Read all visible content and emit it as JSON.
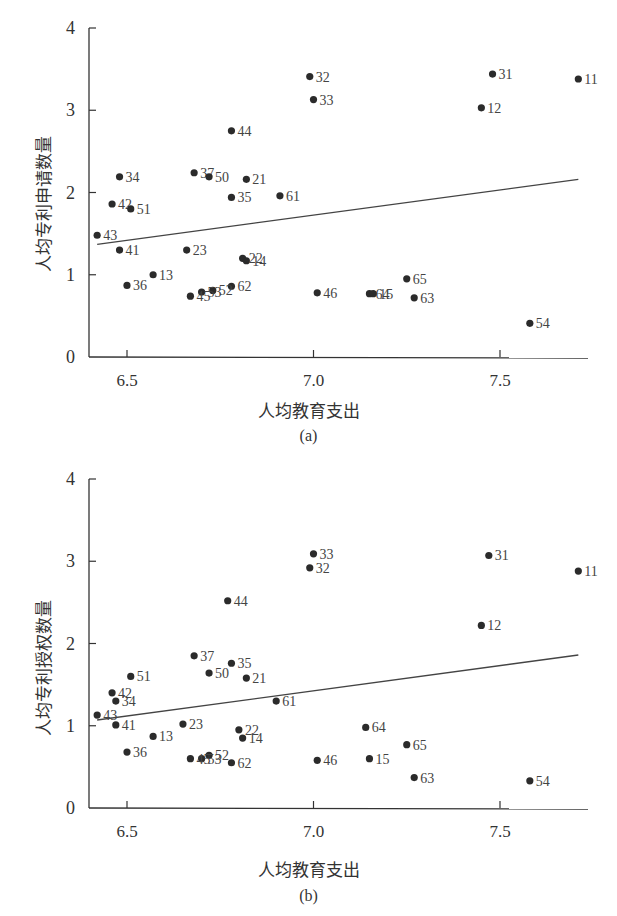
{
  "chart_data": [
    {
      "type": "scatter",
      "panel": "(a)",
      "title": "",
      "xlabel": "人均教育支出",
      "ylabel": "人均专利申请数量",
      "xlim": [
        6.4,
        7.75
      ],
      "ylim": [
        0,
        4
      ],
      "xticks": [
        6.5,
        7.0,
        7.5
      ],
      "xtick_labels": [
        "6.5",
        "7.0",
        "7.5"
      ],
      "yticks": [
        0,
        1,
        2,
        3,
        4
      ],
      "ytick_labels": [
        "0",
        "1",
        "2",
        "3",
        "4"
      ],
      "grid": false,
      "legend": null,
      "trendline": {
        "x": [
          6.42,
          7.71
        ],
        "y": [
          1.37,
          2.16
        ]
      },
      "points": [
        {
          "label": "11",
          "x": 7.71,
          "y": 3.38
        },
        {
          "label": "31",
          "x": 7.48,
          "y": 3.44
        },
        {
          "label": "12",
          "x": 7.45,
          "y": 3.03
        },
        {
          "label": "32",
          "x": 6.99,
          "y": 3.41
        },
        {
          "label": "33",
          "x": 7.0,
          "y": 3.13
        },
        {
          "label": "44",
          "x": 6.78,
          "y": 2.75
        },
        {
          "label": "37",
          "x": 6.68,
          "y": 2.24
        },
        {
          "label": "50",
          "x": 6.72,
          "y": 2.19
        },
        {
          "label": "21",
          "x": 6.82,
          "y": 2.16
        },
        {
          "label": "34",
          "x": 6.48,
          "y": 2.19
        },
        {
          "label": "35",
          "x": 6.78,
          "y": 1.94
        },
        {
          "label": "61",
          "x": 6.91,
          "y": 1.96
        },
        {
          "label": "42",
          "x": 6.46,
          "y": 1.86
        },
        {
          "label": "51",
          "x": 6.51,
          "y": 1.8
        },
        {
          "label": "43",
          "x": 6.42,
          "y": 1.48
        },
        {
          "label": "41",
          "x": 6.48,
          "y": 1.3
        },
        {
          "label": "23",
          "x": 6.66,
          "y": 1.3
        },
        {
          "label": "22",
          "x": 6.81,
          "y": 1.2
        },
        {
          "label": "14",
          "x": 6.82,
          "y": 1.17
        },
        {
          "label": "13",
          "x": 6.57,
          "y": 1.0
        },
        {
          "label": "36",
          "x": 6.5,
          "y": 0.87
        },
        {
          "label": "62",
          "x": 6.78,
          "y": 0.86
        },
        {
          "label": "52",
          "x": 6.73,
          "y": 0.81
        },
        {
          "label": "53",
          "x": 6.7,
          "y": 0.79
        },
        {
          "label": "45",
          "x": 6.67,
          "y": 0.74
        },
        {
          "label": "46",
          "x": 7.01,
          "y": 0.78
        },
        {
          "label": "64",
          "x": 7.15,
          "y": 0.77
        },
        {
          "label": "15",
          "x": 7.16,
          "y": 0.77
        },
        {
          "label": "65",
          "x": 7.25,
          "y": 0.95
        },
        {
          "label": "63",
          "x": 7.27,
          "y": 0.72
        },
        {
          "label": "54",
          "x": 7.58,
          "y": 0.41
        }
      ]
    },
    {
      "type": "scatter",
      "panel": "(b)",
      "title": "",
      "xlabel": "人均教育支出",
      "ylabel": "人均专利授权数量",
      "xlim": [
        6.4,
        7.75
      ],
      "ylim": [
        0,
        4
      ],
      "xticks": [
        6.5,
        7.0,
        7.5
      ],
      "xtick_labels": [
        "6.5",
        "7.0",
        "7.5"
      ],
      "yticks": [
        0,
        1,
        2,
        3,
        4
      ],
      "ytick_labels": [
        "0",
        "1",
        "2",
        "3",
        "4"
      ],
      "grid": false,
      "legend": null,
      "trendline": {
        "x": [
          6.42,
          7.71
        ],
        "y": [
          1.07,
          1.86
        ]
      },
      "points": [
        {
          "label": "33",
          "x": 7.0,
          "y": 3.09
        },
        {
          "label": "32",
          "x": 6.99,
          "y": 2.92
        },
        {
          "label": "31",
          "x": 7.47,
          "y": 3.07
        },
        {
          "label": "11",
          "x": 7.71,
          "y": 2.88
        },
        {
          "label": "12",
          "x": 7.45,
          "y": 2.22
        },
        {
          "label": "44",
          "x": 6.77,
          "y": 2.52
        },
        {
          "label": "37",
          "x": 6.68,
          "y": 1.85
        },
        {
          "label": "35",
          "x": 6.78,
          "y": 1.76
        },
        {
          "label": "50",
          "x": 6.72,
          "y": 1.64
        },
        {
          "label": "21",
          "x": 6.82,
          "y": 1.58
        },
        {
          "label": "51",
          "x": 6.51,
          "y": 1.6
        },
        {
          "label": "42",
          "x": 6.46,
          "y": 1.4
        },
        {
          "label": "34",
          "x": 6.47,
          "y": 1.3
        },
        {
          "label": "43",
          "x": 6.42,
          "y": 1.13
        },
        {
          "label": "41",
          "x": 6.47,
          "y": 1.01
        },
        {
          "label": "61",
          "x": 6.9,
          "y": 1.3
        },
        {
          "label": "23",
          "x": 6.65,
          "y": 1.02
        },
        {
          "label": "22",
          "x": 6.8,
          "y": 0.95
        },
        {
          "label": "14",
          "x": 6.81,
          "y": 0.85
        },
        {
          "label": "13",
          "x": 6.57,
          "y": 0.87
        },
        {
          "label": "36",
          "x": 6.5,
          "y": 0.68
        },
        {
          "label": "52",
          "x": 6.72,
          "y": 0.64
        },
        {
          "label": "53",
          "x": 6.7,
          "y": 0.6
        },
        {
          "label": "45",
          "x": 6.67,
          "y": 0.6
        },
        {
          "label": "62",
          "x": 6.78,
          "y": 0.55
        },
        {
          "label": "64",
          "x": 7.14,
          "y": 0.98
        },
        {
          "label": "65",
          "x": 7.25,
          "y": 0.77
        },
        {
          "label": "46",
          "x": 7.01,
          "y": 0.58
        },
        {
          "label": "15",
          "x": 7.15,
          "y": 0.6
        },
        {
          "label": "63",
          "x": 7.27,
          "y": 0.37
        },
        {
          "label": "54",
          "x": 7.58,
          "y": 0.33
        }
      ]
    }
  ],
  "figure_a": {
    "caption": "(a)",
    "xlabel": "人均教育支出",
    "ylabel": "人均专利申请数量"
  },
  "figure_b": {
    "caption": "(b)",
    "xlabel": "人均教育支出",
    "ylabel": "人均专利授权数量"
  },
  "style": {
    "ink": "#333333",
    "point": "#2b2b2b",
    "label": "#444444"
  }
}
